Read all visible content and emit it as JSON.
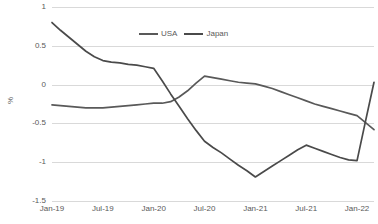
{
  "chart_data": {
    "type": "line",
    "title": "",
    "subtitle": "",
    "xlabel": "",
    "ylabel": "%",
    "ylim": [
      -1.5,
      1
    ],
    "yticks": [
      "1",
      "0.5",
      "0",
      "-0.5",
      "-1",
      "-1.5"
    ],
    "ytick_values": [
      1,
      0.5,
      0,
      -0.5,
      -1,
      -1.5
    ],
    "grid": true,
    "legend_position": "top-center",
    "categories": [
      "Jan-19",
      "Feb-19",
      "Mar-19",
      "Apr-19",
      "May-19",
      "Jun-19",
      "Jul-19",
      "Aug-19",
      "Sep-19",
      "Oct-19",
      "Nov-19",
      "Dec-19",
      "Jan-20",
      "Feb-20",
      "Mar-20",
      "Apr-20",
      "May-20",
      "Jun-20",
      "Jul-20",
      "Aug-20",
      "Sep-20",
      "Oct-20",
      "Nov-20",
      "Dec-20",
      "Jan-21",
      "Feb-21",
      "Mar-21",
      "Apr-21",
      "May-21",
      "Jun-21",
      "Jul-21",
      "Aug-21",
      "Sep-21",
      "Oct-21",
      "Nov-21",
      "Dec-21",
      "Jan-22",
      "Feb-22",
      "Mar-22"
    ],
    "xticks": [
      "Jan-19",
      "Jul-19",
      "Jan-20",
      "Jul-20",
      "Jan-21",
      "Jul-21",
      "Jan-22"
    ],
    "xtick_indices": [
      0,
      6,
      12,
      18,
      24,
      30,
      36
    ],
    "series": [
      {
        "name": "USA",
        "color": "#595959",
        "values": [
          -0.26,
          -0.27,
          -0.28,
          -0.29,
          -0.3,
          -0.3,
          -0.3,
          -0.29,
          -0.28,
          -0.27,
          -0.26,
          -0.25,
          -0.24,
          -0.24,
          -0.22,
          -0.16,
          -0.08,
          0.02,
          0.11,
          0.09,
          0.07,
          0.05,
          0.03,
          0.02,
          0.01,
          -0.02,
          -0.05,
          -0.09,
          -0.13,
          -0.17,
          -0.21,
          -0.25,
          -0.28,
          -0.31,
          -0.34,
          -0.37,
          -0.4,
          -0.49,
          -0.58
        ]
      },
      {
        "name": "Japan",
        "color": "#4a4a4a",
        "values": [
          0.8,
          0.7,
          0.61,
          0.52,
          0.43,
          0.36,
          0.31,
          0.29,
          0.28,
          0.26,
          0.25,
          0.23,
          0.21,
          0.05,
          -0.12,
          -0.28,
          -0.44,
          -0.59,
          -0.73,
          -0.81,
          -0.88,
          -0.96,
          -1.04,
          -1.11,
          -1.19,
          -1.12,
          -1.05,
          -0.98,
          -0.91,
          -0.84,
          -0.78,
          -0.82,
          -0.86,
          -0.9,
          -0.94,
          -0.97,
          -0.98,
          -0.47,
          0.03
        ]
      }
    ]
  },
  "legend": {
    "items": [
      {
        "label": "USA"
      },
      {
        "label": "Japan"
      }
    ]
  },
  "colors": {
    "usa_line": "#595959",
    "japan_line": "#4a4a4a",
    "gridline": "#d9d9d9",
    "text": "#595959",
    "background": "#ffffff"
  }
}
